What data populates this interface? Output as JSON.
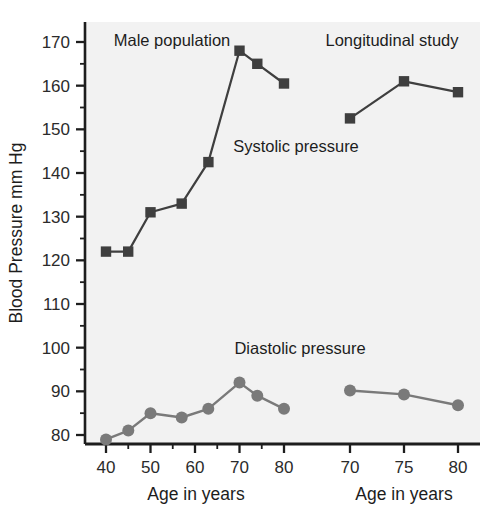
{
  "chart_data": {
    "type": "line",
    "title": "",
    "ylabel": "Blood Pressure mm Hg",
    "ylim": [
      76,
      173
    ],
    "yticks": [
      80,
      90,
      100,
      110,
      120,
      130,
      140,
      150,
      160,
      170
    ],
    "grid": false,
    "legend": "inline annotations",
    "panels": [
      {
        "name": "cross-sectional",
        "annotation": "Male population",
        "xlabel": "Age in years",
        "xlim": [
          36,
          83
        ],
        "xticks": [
          40,
          50,
          60,
          70,
          80
        ],
        "series": [
          {
            "name": "Systolic pressure",
            "marker": "square",
            "color": "#3f3f3f",
            "x": [
              40,
              45,
              50,
              57,
              63,
              70,
              74,
              80
            ],
            "values": [
              122,
              122,
              131,
              133,
              142.5,
              168,
              165,
              160.5
            ]
          },
          {
            "name": "Diastolic pressure",
            "marker": "circle",
            "color": "#7a7a7a",
            "x": [
              40,
              45,
              50,
              57,
              63,
              70,
              74,
              80
            ],
            "values": [
              79,
              81,
              85,
              84,
              86,
              92,
              89,
              86
            ]
          }
        ]
      },
      {
        "name": "longitudinal",
        "annotation": "Longitudinal study",
        "xlabel": "Age in years",
        "xlim": [
          67,
          83
        ],
        "xticks": [
          70,
          75,
          80
        ],
        "series": [
          {
            "name": "Systolic pressure",
            "marker": "square",
            "color": "#3f3f3f",
            "x": [
              70,
              75,
              80
            ],
            "values": [
              152.5,
              161,
              158.5
            ]
          },
          {
            "name": "Diastolic pressure",
            "marker": "circle",
            "color": "#7a7a7a",
            "x": [
              70,
              75,
              80
            ],
            "values": [
              90.2,
              89.3,
              86.8
            ]
          }
        ]
      }
    ],
    "annotations": [
      {
        "text": "Male population",
        "x": 47,
        "y": 169
      },
      {
        "text": "Longitudinal study",
        "x": 73,
        "y": 169
      },
      {
        "text": "Systolic pressure",
        "x": 58,
        "y": 144
      },
      {
        "text": "Diastolic pressure",
        "x": 58,
        "y": 97
      }
    ]
  },
  "axes": {
    "y_title": "Blood Pressure mm Hg",
    "y_tick_labels": [
      "170",
      "160",
      "150",
      "140",
      "130",
      "120",
      "110",
      "100",
      "90",
      "80"
    ],
    "x_tick_labels_left": [
      "40",
      "50",
      "60",
      "70",
      "80"
    ],
    "x_tick_labels_right": [
      "70",
      "75",
      "80"
    ],
    "x_title_left": "Age in years",
    "x_title_right": "Age in years"
  },
  "annotations": {
    "male_population": "Male population",
    "longitudinal_study": "Longitudinal study",
    "systolic_pressure": "Systolic pressure",
    "diastolic_pressure": "Diastolic pressure"
  },
  "colors": {
    "plot_background": "#f2f2f2",
    "page_background": "#ffffff",
    "systolic": "#3f3f3f",
    "diastolic": "#7a7a7a",
    "axis": "#1d1d1d",
    "text": "#1d1d1d"
  }
}
